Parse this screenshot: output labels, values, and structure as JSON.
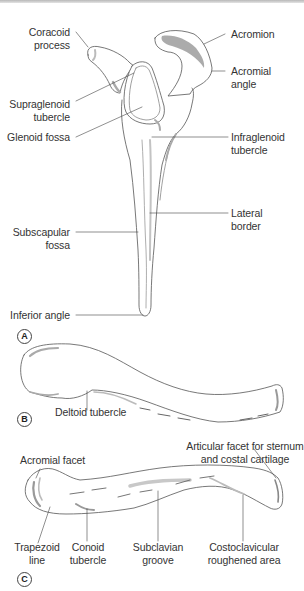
{
  "figure": {
    "panels": [
      {
        "id": "A",
        "subject": "scapula-lateral-view",
        "labels": {
          "coracoid_process": "Coracoid\nprocess",
          "coracoid_line1": "Coracoid",
          "coracoid_line2": "process",
          "acromion": "Acromion",
          "acromial_angle_line1": "Acromial",
          "acromial_angle_line2": "angle",
          "supraglenoid_line1": "Supraglenoid",
          "supraglenoid_line2": "tubercle",
          "glenoid_fossa": "Glenoid fossa",
          "infraglenoid_line1": "Infraglenoid",
          "infraglenoid_line2": "tubercle",
          "lateral_border_line1": "Lateral",
          "lateral_border_line2": "border",
          "subscapular_line1": "Subscapular",
          "subscapular_line2": "fossa",
          "inferior_angle": "Inferior angle"
        }
      },
      {
        "id": "B",
        "subject": "clavicle-superior-view",
        "labels": {
          "deltoid_tubercle": "Deltoid tubercle"
        }
      },
      {
        "id": "C",
        "subject": "clavicle-inferior-view",
        "labels": {
          "articular_facet_line1": "Articular facet for sternum",
          "articular_facet_line2": "and costal cartilage",
          "acromial_facet": "Acromial facet",
          "trapezoid_line1": "Trapezoid",
          "trapezoid_line2": "line",
          "conoid_line1": "Conoid",
          "conoid_line2": "tubercle",
          "subclavian_line1": "Subclavian",
          "subclavian_line2": "groove",
          "costoclavicular_line1": "Costoclavicular",
          "costoclavicular_line2": "roughened area"
        }
      }
    ],
    "badges": {
      "a": "A",
      "b": "B",
      "c": "C"
    },
    "colors": {
      "outline": "#555555",
      "shade": "#b5b5b5",
      "dark_shade": "#8a8a8a",
      "leader": "#444444",
      "text": "#333333"
    }
  }
}
